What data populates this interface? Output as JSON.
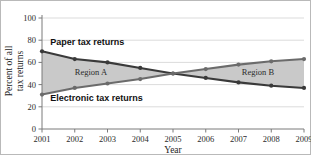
{
  "chart_data": {
    "type": "line",
    "title": "",
    "xlabel": "Year",
    "ylabel": "Percent of all tax returns",
    "ylabel_line1": "Percent of all",
    "ylabel_line2": "tax returns",
    "categories": [
      "2001",
      "2002",
      "2003",
      "2004",
      "2005",
      "2006",
      "2007",
      "2008",
      "2009"
    ],
    "x": [
      2001,
      2002,
      2003,
      2004,
      2005,
      2006,
      2007,
      2008,
      2009
    ],
    "xlim": [
      2001,
      2009
    ],
    "ylim": [
      0,
      100
    ],
    "yticks": [
      0,
      20,
      40,
      60,
      80,
      100
    ],
    "ytick_labels": [
      "0",
      "20",
      "40",
      "60",
      "80",
      "100"
    ],
    "grid": true,
    "legend_position": "inline-annotations",
    "series": [
      {
        "name": "Paper tax returns",
        "values": [
          70,
          63,
          60,
          55,
          50,
          46,
          42,
          39,
          37
        ],
        "color": "#3a3a3a",
        "marker": "circle"
      },
      {
        "name": "Electronic tax returns",
        "values": [
          31,
          37,
          41,
          45,
          50,
          54,
          58,
          61,
          63
        ],
        "color": "#6b6b6b",
        "marker": "circle"
      }
    ],
    "shaded_regions": [
      {
        "label": "Region A",
        "from_year": 2001,
        "to_year": 2005,
        "fill": "#c9c9c9"
      },
      {
        "label": "Region B",
        "from_year": 2005,
        "to_year": 2009,
        "fill": "#c9c9c9"
      }
    ],
    "annotations": [
      {
        "text": "Paper tax returns",
        "x": 2001.25,
        "y": 76
      },
      {
        "text": "Electronic tax returns",
        "x": 2001.25,
        "y": 25
      },
      {
        "text": "Region A",
        "x": 2002.0,
        "y": 49
      },
      {
        "text": "Region B",
        "x": 2007.1,
        "y": 49
      }
    ],
    "colors": {
      "grid": "#d2d2d2",
      "axis": "#7a7a7a",
      "plot_background": "#ffffff",
      "figure_border": "#b9b9b9",
      "shade": "#c9c9c9",
      "paper_series": "#3a3a3a",
      "electronic_series": "#6b6b6b"
    }
  }
}
